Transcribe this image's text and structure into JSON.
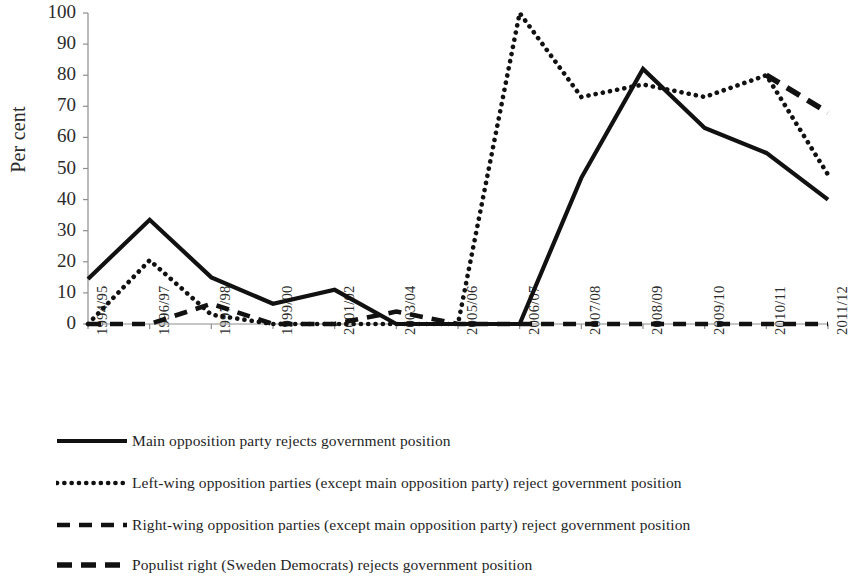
{
  "chart": {
    "type": "line",
    "ylabel": "Per cent",
    "ytick_labels": [
      "100",
      "90",
      "80",
      "70",
      "60",
      "50",
      "40",
      "30",
      "20",
      "10",
      "0"
    ],
    "xtick_labels": [
      "1994/95",
      "1996/97",
      "1997/98",
      "1999/00",
      "2001/02",
      "2003/04",
      "2005/06",
      "2006/07",
      "2007/08",
      "2008/09",
      "2009/10",
      "2010/11",
      "2011/12"
    ]
  },
  "legend": {
    "items": [
      {
        "label": "Main opposition party rejects government position",
        "style": "solid"
      },
      {
        "label": "Left-wing opposition parties (except main opposition party) reject government position",
        "style": "dotted"
      },
      {
        "label": "Right-wing opposition parties (except main opposition party) reject government position",
        "style": "dashed-long"
      },
      {
        "label": "Populist right (Sweden Democrats) rejects government position",
        "style": "dashed-short"
      }
    ]
  },
  "chart_data": {
    "type": "line",
    "title": "",
    "xlabel": "",
    "ylabel": "Per cent",
    "ylim": [
      0,
      100
    ],
    "yticks": [
      0,
      10,
      20,
      30,
      40,
      50,
      60,
      70,
      80,
      90,
      100
    ],
    "grid": false,
    "legend_position": "below",
    "categories": [
      "1994/95",
      "1996/97",
      "1997/98",
      "1999/00",
      "2001/02",
      "2003/04",
      "2005/06",
      "2006/07",
      "2007/08",
      "2008/09",
      "2009/10",
      "2010/11",
      "2011/12"
    ],
    "series": [
      {
        "name": "Main opposition party rejects government position",
        "style": "solid",
        "color": "#111111",
        "values": [
          14.5,
          33.5,
          15,
          6.5,
          11,
          0,
          0,
          0,
          47,
          82,
          63,
          55,
          40
        ]
      },
      {
        "name": "Left-wing opposition parties (except main opposition party) reject government position",
        "style": "dotted",
        "color": "#111111",
        "values": [
          0,
          20.5,
          3,
          0,
          0,
          0,
          0,
          100,
          73,
          77,
          73,
          80,
          48
        ]
      },
      {
        "name": "Right-wing opposition parties (except main opposition party) reject government position",
        "style": "dashed-long",
        "color": "#111111",
        "values": [
          0,
          0,
          6.5,
          0,
          0,
          4,
          0,
          0,
          0,
          0,
          0,
          0,
          0
        ]
      },
      {
        "name": "Populist right (Sweden Democrats) rejects government position",
        "style": "dashed-short",
        "color": "#111111",
        "values": [
          null,
          null,
          null,
          null,
          null,
          null,
          null,
          null,
          null,
          null,
          null,
          80,
          68
        ]
      }
    ]
  }
}
